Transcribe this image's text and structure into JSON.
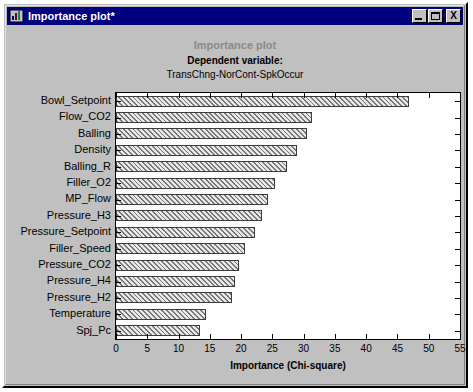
{
  "window": {
    "title": "Importance plot*",
    "icon": "chart-app-icon",
    "buttons": {
      "minimize": "_",
      "maximize": "▫",
      "close": "X"
    }
  },
  "chart_data": {
    "type": "bar",
    "orientation": "horizontal",
    "title": "Importance plot",
    "subtitle_label": "Dependent variable:",
    "subtitle_value": "TransChng-NorCont-SpkOccur",
    "xlabel": "Importance (Chi-square)",
    "ylabel": "",
    "xlim": [
      0,
      55
    ],
    "xticks": [
      0,
      5,
      10,
      15,
      20,
      25,
      30,
      35,
      40,
      45,
      50,
      55
    ],
    "grid": false,
    "legend": false,
    "categories": [
      "Bowl_Setpoint",
      "Flow_CO2",
      "Balling",
      "Density",
      "Balling_R",
      "Filler_O2",
      "MP_Flow",
      "Pressure_H3",
      "Pressure_Setpoint",
      "Filler_Speed",
      "Pressure_CO2",
      "Pressure_H4",
      "Pressure_H2",
      "Temperature",
      "Spj_Pc"
    ],
    "values": [
      46.8,
      31.3,
      30.5,
      29.0,
      27.4,
      25.4,
      24.3,
      23.3,
      22.2,
      20.6,
      19.7,
      19.0,
      18.6,
      14.4,
      13.5
    ]
  }
}
